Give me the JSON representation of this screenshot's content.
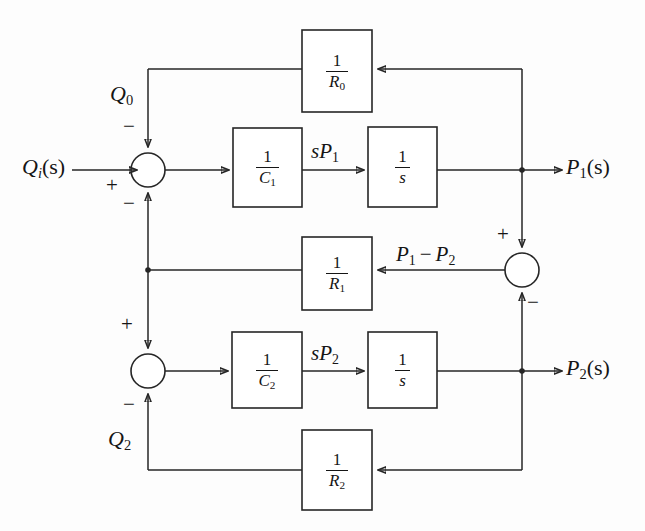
{
  "diagram": {
    "type": "control-system-block-diagram",
    "stroke_color": "#262626",
    "text_color": "#151515",
    "background_color": "#fdfdfd",
    "signals": {
      "input": "Q",
      "input_sub": "i",
      "input_arg": "(s)",
      "q0": "Q",
      "q0_sub": "0",
      "q2": "Q",
      "q2_sub": "2",
      "sp1": "sP",
      "sp1_sub": "1",
      "sp2": "sP",
      "sp2_sub": "2",
      "p1_minus_p2_a": "P",
      "p1_minus_p2_a_sub": "1",
      "p1_minus_p2_op": "−",
      "p1_minus_p2_b": "P",
      "p1_minus_p2_b_sub": "2",
      "out1": "P",
      "out1_sub": "1",
      "out1_arg": "(s)",
      "out2": "P",
      "out2_sub": "2",
      "out2_arg": "(s)"
    },
    "blocks": [
      {
        "id": "r0",
        "num": "1",
        "den": "R",
        "den_sub": "0",
        "x": 302,
        "y": 30,
        "w": 70,
        "h": 82
      },
      {
        "id": "c1",
        "num": "1",
        "den": "C",
        "den_sub": "1",
        "x": 233,
        "y": 128,
        "w": 69,
        "h": 79
      },
      {
        "id": "s1",
        "num": "1",
        "den": "s",
        "den_sub": "",
        "x": 368,
        "y": 127,
        "w": 69,
        "h": 80
      },
      {
        "id": "r1",
        "num": "1",
        "den": "R",
        "den_sub": "1",
        "x": 302,
        "y": 237,
        "w": 70,
        "h": 73
      },
      {
        "id": "c2",
        "num": "1",
        "den": "C",
        "den_sub": "2",
        "x": 232,
        "y": 332,
        "w": 70,
        "h": 76
      },
      {
        "id": "s2",
        "num": "1",
        "den": "s",
        "den_sub": "",
        "x": 368,
        "y": 332,
        "w": 69,
        "h": 76
      },
      {
        "id": "r2",
        "num": "1",
        "den": "R",
        "den_sub": "2",
        "x": 302,
        "y": 430,
        "w": 70,
        "h": 80
      }
    ],
    "summing_junctions": [
      {
        "id": "sum1",
        "cx": 148,
        "cy": 170,
        "r": 17,
        "ports": [
          {
            "side": "top",
            "sign": "−"
          },
          {
            "side": "left",
            "sign": "+"
          },
          {
            "side": "bottom",
            "sign": "−"
          }
        ]
      },
      {
        "id": "sum2",
        "cx": 148,
        "cy": 371,
        "r": 17,
        "ports": [
          {
            "side": "top",
            "sign": "+"
          },
          {
            "side": "bottom",
            "sign": "−"
          }
        ]
      },
      {
        "id": "sum3",
        "cx": 522,
        "cy": 270,
        "r": 17,
        "ports": [
          {
            "side": "top",
            "sign": "+"
          },
          {
            "side": "bottom",
            "sign": "−"
          }
        ]
      }
    ],
    "signs": {
      "sum1_top": "−",
      "sum1_left": "+",
      "sum1_bottom": "−",
      "sum2_top": "+",
      "sum2_bottom": "−",
      "sum3_top": "+",
      "sum3_bottom": "−"
    },
    "tap_points": [
      {
        "id": "tap-p1",
        "x": 522,
        "y": 170
      },
      {
        "id": "tap-p2",
        "x": 522,
        "y": 371
      },
      {
        "id": "tap-left-bus",
        "x": 148,
        "y": 270
      }
    ]
  }
}
